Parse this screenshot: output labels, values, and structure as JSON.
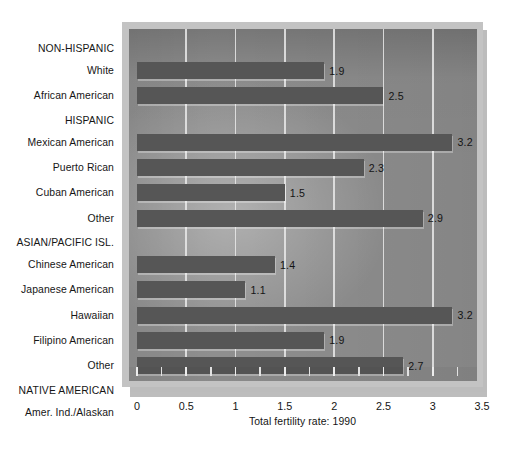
{
  "chart_data": {
    "type": "bar",
    "orientation": "horizontal",
    "title": "",
    "xlabel": "Total fertility rate: 1990",
    "ylabel": "",
    "xlim": [
      0,
      3.5
    ],
    "xticks": [
      "0",
      "0.5",
      "1",
      "1.5",
      "2",
      "2.5",
      "3",
      "3.5"
    ],
    "xtick_values": [
      0,
      0.5,
      1,
      1.5,
      2,
      2.5,
      3,
      3.5
    ],
    "grid": true,
    "legend": "none",
    "categories": [
      "White",
      "African American",
      "Mexican American",
      "Puerto Rican",
      "Cuban American",
      "Other",
      "Chinese American",
      "Japanese American",
      "Hawaiian",
      "Filipino American",
      "Other",
      "Amer. Ind./Alaskan"
    ],
    "values": [
      1.9,
      2.5,
      3.2,
      2.3,
      1.5,
      2.9,
      1.4,
      1.1,
      3.2,
      1.9,
      2.7,
      2.2
    ],
    "value_labels": [
      "1.9",
      "2.5",
      "3.2",
      "2.3",
      "1.5",
      "2.9",
      "1.4",
      "1.1",
      "3.2",
      "1.9",
      "2.7",
      "2.2"
    ],
    "groups": [
      {
        "heading": "NON-HISPANIC",
        "categories": [
          "White",
          "African American"
        ]
      },
      {
        "heading": "HISPANIC",
        "categories": [
          "Mexican American",
          "Puerto Rican",
          "Cuban American",
          "Other"
        ]
      },
      {
        "heading": "ASIAN/PACIFIC ISL.",
        "categories": [
          "Chinese American",
          "Japanese American",
          "Hawaiian",
          "Filipino American",
          "Other"
        ]
      },
      {
        "heading": "NATIVE AMERICAN",
        "categories": [
          "Amer. Ind./Alaskan"
        ]
      }
    ],
    "group_headings": [
      "NON-HISPANIC",
      "HISPANIC",
      "ASIAN/PACIFIC ISL.",
      "NATIVE AMERICAN"
    ],
    "colors": {
      "bar": "#565656",
      "plot_background": "#8f8f8f",
      "frame": "#c3c3c3",
      "gridline": "#e9e9e9",
      "shadow": "#bcbcbc",
      "text": "#141414",
      "page_background": "#ffffff"
    }
  }
}
